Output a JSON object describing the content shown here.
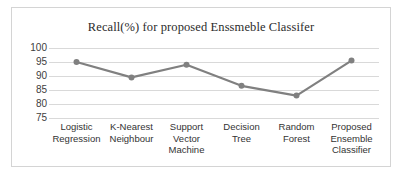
{
  "chart_data": {
    "type": "line",
    "title": "Recall(%) for proposed Enssmeble Classifer",
    "xlabel": "",
    "ylabel": "",
    "categories": [
      "Logistic Regression",
      "K-Nearest Neighbour",
      "Support Vector Machine",
      "Decision Tree",
      "Random Forest",
      "Proposed Ensemble Classifier"
    ],
    "values": [
      95,
      89.5,
      94,
      86.5,
      83,
      95.5
    ],
    "ylim": [
      75,
      100
    ],
    "yticks": [
      100,
      95,
      90,
      85,
      80,
      75
    ],
    "ytick_labels": [
      "100",
      "95",
      "90",
      "85",
      "80",
      "75"
    ],
    "grid": true,
    "legend": false,
    "series_color": "#808080",
    "marker": "circle",
    "gridline_color": "#d9d9d9",
    "border_color": "#d4d4d4"
  }
}
